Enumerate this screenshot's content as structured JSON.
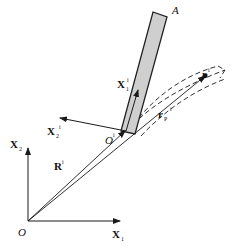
{
  "diagram": {
    "type": "kinematics-frame-diagram",
    "colors": {
      "ink": "#1a1a1a",
      "bar_fill": "#cfcfcf",
      "bar_stroke": "#222222"
    },
    "labels": {
      "bar_end": "A",
      "global_origin": "O",
      "local_origin": "O",
      "local_origin_sup": "i",
      "global_x1": "X",
      "global_x1_sub": "1",
      "global_x2": "X",
      "global_x2_sub": "2",
      "local_x1": "X",
      "local_x1_sub": "1",
      "local_x1_sup": "i",
      "local_x2": "X",
      "local_x2_sub": "2",
      "local_x2_sup": "i",
      "position_R": "R",
      "position_R_sup": "i",
      "point_P": "P",
      "point_P_sup": "i",
      "vector_rp": "r",
      "vector_rp_sub": "P",
      "vector_rp_sup": "i"
    }
  }
}
